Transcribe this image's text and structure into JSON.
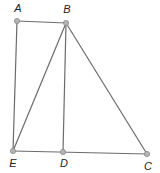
{
  "diagram": {
    "title": "",
    "points": [
      {
        "id": "A",
        "label": "A",
        "x": 17,
        "y": 21,
        "lx": 18,
        "ly": 12
      },
      {
        "id": "B",
        "label": "B",
        "x": 66,
        "y": 23,
        "lx": 67,
        "ly": 13
      },
      {
        "id": "E",
        "label": "E",
        "x": 13,
        "y": 151,
        "lx": 13,
        "ly": 167
      },
      {
        "id": "D",
        "label": "D",
        "x": 63,
        "y": 152,
        "lx": 64,
        "ly": 167
      },
      {
        "id": "C",
        "label": "C",
        "x": 147,
        "y": 154,
        "lx": 148,
        "ly": 170
      }
    ],
    "segments": [
      [
        "A",
        "B"
      ],
      [
        "A",
        "E"
      ],
      [
        "B",
        "E"
      ],
      [
        "B",
        "D"
      ],
      [
        "B",
        "C"
      ],
      [
        "E",
        "C"
      ]
    ],
    "colors": {
      "line": "#6b6b6b",
      "point_fill": "#b4b4b4",
      "label": "#222222"
    }
  }
}
